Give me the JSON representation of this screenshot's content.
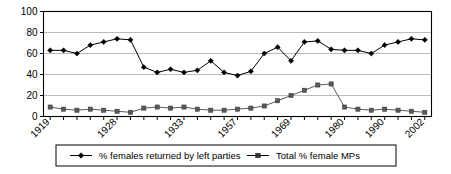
{
  "chart_data": {
    "type": "line",
    "title": "",
    "subtitle": "",
    "xlabel": "",
    "ylabel": "",
    "ylim": [
      0,
      100
    ],
    "yticks": [
      0,
      20,
      40,
      60,
      80,
      100
    ],
    "grid": true,
    "legend_position": "bottom",
    "x_tick_labels": [
      "1919",
      "1928",
      "1933",
      "1957",
      "1969",
      "1980",
      "1990",
      "2002"
    ],
    "x_tick_label_indices": [
      0,
      5,
      10,
      14,
      18,
      22,
      25,
      28
    ],
    "x_point_count": 29,
    "series": [
      {
        "name": "%  females returned by left parties",
        "marker": "diamond",
        "color": "#000000",
        "values": [
          63,
          63,
          60,
          68,
          71,
          74,
          73,
          47,
          42,
          45,
          42,
          44,
          53,
          42,
          39,
          43,
          60,
          66,
          53,
          71,
          72,
          64,
          63,
          63,
          60,
          68,
          71,
          74,
          73
        ]
      },
      {
        "name": "Total % female MPs",
        "marker": "square",
        "color": "#595959",
        "values": [
          9,
          7,
          6,
          7,
          6,
          5,
          4,
          8,
          9,
          8,
          9,
          7,
          6,
          6,
          7,
          8,
          10,
          15,
          20,
          25,
          30,
          31,
          9,
          7,
          6,
          7,
          6,
          5,
          4
        ]
      }
    ]
  },
  "legend": {
    "entries": [
      {
        "label": "%  females returned by left parties",
        "marker": "diamond"
      },
      {
        "label": "Total % female MPs",
        "marker": "square"
      }
    ]
  }
}
